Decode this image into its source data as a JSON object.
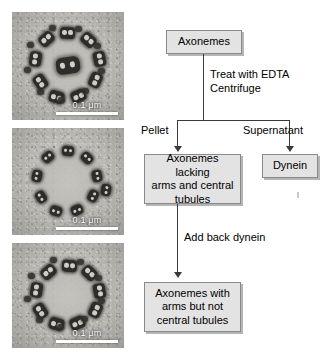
{
  "figure": {
    "type": "scientific-figure"
  },
  "micrographs": [
    {
      "id": "panel-intact-axoneme",
      "scale_label": "0.1 μm",
      "caption_implied": "Intact axoneme with dynein arms and central tubules",
      "doublet_count": 9,
      "has_central_pair": true,
      "has_arms": true
    },
    {
      "id": "panel-stripped-axoneme",
      "scale_label": "0.1 μm",
      "caption_implied": "Axoneme lacking arms and central tubules",
      "doublet_count": 9,
      "has_central_pair": false,
      "has_arms": false
    },
    {
      "id": "panel-reconstituted-axoneme",
      "scale_label": "0.1 μm",
      "caption_implied": "Axoneme with arms but not central tubules",
      "doublet_count": 9,
      "has_central_pair": false,
      "has_arms": true
    }
  ],
  "flowchart": {
    "nodes": {
      "start": "Axonemes",
      "pellet_product": "Axonemes lacking\narms and central\ntubules",
      "pellet_product_lines": [
        "Axonemes lacking",
        "arms and central",
        "tubules"
      ],
      "supernatant_product": "Dynein",
      "final_product_lines": [
        "Axonemes with",
        "arms but not",
        "central tubules"
      ]
    },
    "edge_labels": {
      "treatment_line1": "Treat with EDTA",
      "treatment_line2": "Centrifuge",
      "pellet": "Pellet",
      "supernatant": "Supernatant",
      "add_back": "Add back dynein"
    },
    "colors": {
      "box_fill": "#e3e3e3",
      "box_border": "#8a8a8a",
      "line": "#3a3a3a",
      "shadow": "#787878"
    }
  }
}
